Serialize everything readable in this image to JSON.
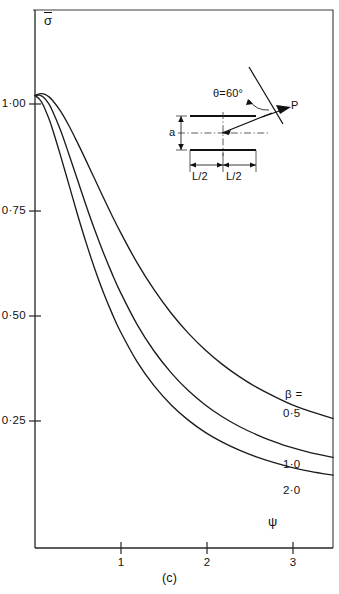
{
  "figure": {
    "caption": "(c)",
    "panel_id": "c"
  },
  "axes": {
    "y_title": "σ",
    "y_title_overbar": true,
    "x_title": "ψ",
    "y_ticks": [
      {
        "value": 1.0,
        "label": "1·00"
      },
      {
        "value": 0.75,
        "label": "0·75"
      },
      {
        "value": 0.5,
        "label": "0·50"
      },
      {
        "value": 0.25,
        "label": "0·25"
      }
    ],
    "x_ticks": [
      {
        "value": 1,
        "label": "1"
      },
      {
        "value": 2,
        "label": "2"
      },
      {
        "value": 3,
        "label": "3"
      }
    ]
  },
  "legend": {
    "parameter_label": "β =",
    "entries": [
      {
        "label": "0·5",
        "value": 0.5
      },
      {
        "label": "1·0",
        "value": 1.0
      },
      {
        "label": "2·0",
        "value": 2.0
      }
    ]
  },
  "inset": {
    "angle_label": "θ=60°",
    "force_label": "P",
    "height_label": "a",
    "half_length_left": "L/2",
    "half_length_right": "L/2"
  },
  "chart_data": {
    "type": "line",
    "title": "",
    "subtitle": "(c)",
    "xlabel": "ψ",
    "ylabel": "σ",
    "xlim": [
      0,
      3.5
    ],
    "ylim": [
      0,
      1.1
    ],
    "xticks": [
      1,
      2,
      3
    ],
    "yticks": [
      0.25,
      0.5,
      0.75,
      1.0
    ],
    "grid": false,
    "legend_position": "right-inside",
    "legend_title": "β =",
    "annotations": [
      "θ=60°",
      "P",
      "a",
      "L/2",
      "L/2"
    ],
    "series": [
      {
        "name": "β = 0·5",
        "label": "0·5",
        "x": [
          0.0,
          0.05,
          0.1,
          0.15,
          0.2,
          0.3,
          0.4,
          0.5,
          0.6,
          0.7,
          0.8,
          0.9,
          1.0,
          1.2,
          1.4,
          1.6,
          1.8,
          2.0,
          2.2,
          2.4,
          2.6,
          2.8,
          3.0,
          3.2,
          3.4,
          3.5
        ],
        "y": [
          1.02,
          1.024,
          1.024,
          1.019,
          1.01,
          0.983,
          0.948,
          0.908,
          0.866,
          0.823,
          0.78,
          0.738,
          0.698,
          0.624,
          0.56,
          0.505,
          0.458,
          0.418,
          0.384,
          0.355,
          0.33,
          0.309,
          0.29,
          0.275,
          0.262,
          0.256
        ]
      },
      {
        "name": "β = 1·0",
        "label": "1·0",
        "x": [
          0.0,
          0.05,
          0.1,
          0.15,
          0.2,
          0.3,
          0.4,
          0.5,
          0.6,
          0.7,
          0.8,
          0.9,
          1.0,
          1.2,
          1.4,
          1.6,
          1.8,
          2.0,
          2.2,
          2.4,
          2.6,
          2.8,
          3.0,
          3.2,
          3.4,
          3.5
        ],
        "y": [
          1.02,
          1.021,
          1.016,
          1.004,
          0.986,
          0.938,
          0.88,
          0.82,
          0.76,
          0.703,
          0.65,
          0.601,
          0.556,
          0.478,
          0.415,
          0.364,
          0.322,
          0.288,
          0.26,
          0.237,
          0.218,
          0.202,
          0.188,
          0.177,
          0.168,
          0.164
        ]
      },
      {
        "name": "β = 2·0",
        "label": "2·0",
        "x": [
          0.0,
          0.05,
          0.1,
          0.15,
          0.2,
          0.3,
          0.4,
          0.5,
          0.6,
          0.7,
          0.8,
          0.9,
          1.0,
          1.2,
          1.4,
          1.6,
          1.8,
          2.0,
          2.2,
          2.4,
          2.6,
          2.8,
          3.0,
          3.2,
          3.4,
          3.5
        ],
        "y": [
          1.02,
          1.012,
          0.996,
          0.972,
          0.944,
          0.878,
          0.808,
          0.738,
          0.672,
          0.611,
          0.556,
          0.507,
          0.463,
          0.39,
          0.333,
          0.288,
          0.252,
          0.223,
          0.2,
          0.181,
          0.165,
          0.152,
          0.141,
          0.132,
          0.125,
          0.122
        ]
      }
    ]
  }
}
